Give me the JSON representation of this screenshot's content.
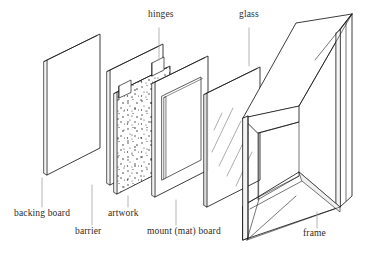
{
  "figure": {
    "kind": "exploded-isometric-diagram",
    "background_color": "#ffffff",
    "ink_color": "#1a1a1a",
    "leader_line_color": "#9a9a9a",
    "label_color": "#2b2b2b"
  },
  "labels": {
    "hinges": "hinges",
    "glass": "glass",
    "backing_board": "backing board",
    "barrier": "barrier",
    "artwork": "artwork",
    "mount_mat_board": "mount (mat) board",
    "frame": "frame"
  },
  "components": [
    {
      "id": "backing-board",
      "label": "backing board",
      "order": 1,
      "texture": "plain",
      "label_position": "bottom"
    },
    {
      "id": "barrier",
      "label": "barrier",
      "order": 2,
      "texture": "plain",
      "label_position": "bottom"
    },
    {
      "id": "artwork",
      "label": "artwork",
      "order": 3,
      "texture": "stippled",
      "label_position": "bottom"
    },
    {
      "id": "hinges",
      "label": "hinges",
      "order": 4,
      "texture": "tab",
      "label_position": "top"
    },
    {
      "id": "mount-mat-board",
      "label": "mount (mat) board",
      "order": 5,
      "texture": "aperture-window",
      "label_position": "bottom"
    },
    {
      "id": "glass",
      "label": "glass",
      "order": 6,
      "texture": "reflection-hatching",
      "label_position": "top"
    },
    {
      "id": "frame",
      "label": "frame",
      "order": 7,
      "texture": "molding",
      "label_position": "bottom"
    }
  ]
}
